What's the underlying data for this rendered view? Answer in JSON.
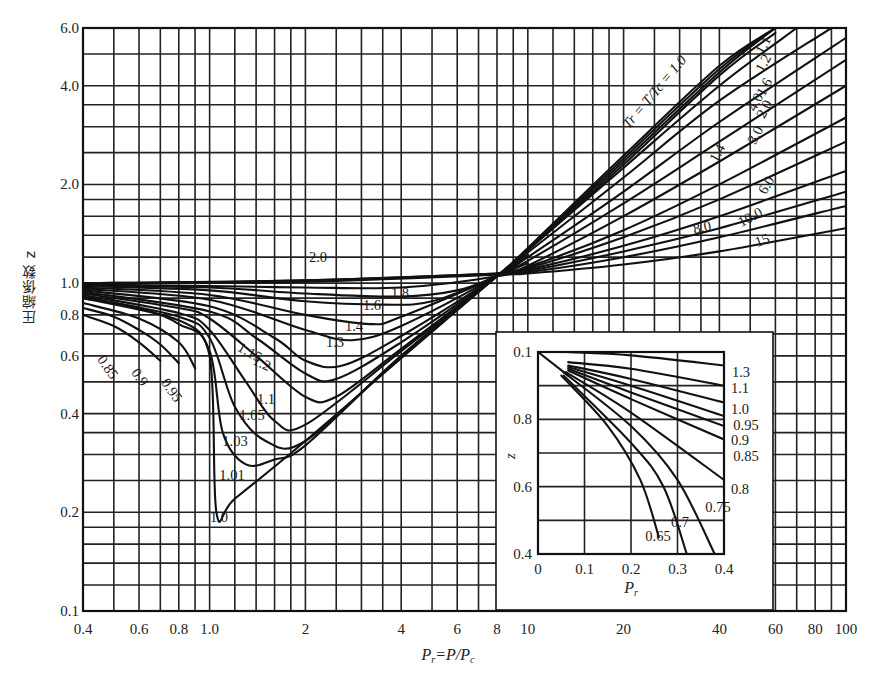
{
  "chart_data": {
    "type": "line",
    "title": "",
    "xlabel": "Pr = P/Pc",
    "ylabel": "圧縮係数 z",
    "xscale": "log",
    "yscale": "log",
    "xlim": [
      0.4,
      100
    ],
    "ylim": [
      0.1,
      6.0
    ],
    "grid": true,
    "legend_position": "none (inline curve labels)",
    "x_tick_labels": [
      "0.4",
      "0.6",
      "0.8",
      "1.0",
      "2",
      "4",
      "6",
      "8",
      "10",
      "20",
      "40",
      "60",
      "80",
      "100"
    ],
    "x_ticks": [
      0.4,
      0.6,
      0.8,
      1.0,
      2,
      4,
      6,
      8,
      10,
      20,
      40,
      60,
      80,
      100
    ],
    "y_tick_labels": [
      "0.1",
      "0.2",
      "0.4",
      "0.6",
      "0.8",
      "1.0",
      "2.0",
      "4.0",
      "6.0"
    ],
    "y_ticks": [
      0.1,
      0.2,
      0.4,
      0.6,
      0.8,
      1.0,
      2.0,
      4.0,
      6.0
    ],
    "family_label": "Tr = T/Tc = 1.0",
    "series": [
      {
        "name": "0.85",
        "x": [
          0.4,
          0.5,
          0.6,
          0.7
        ],
        "z": [
          0.8,
          0.74,
          0.66,
          0.58
        ]
      },
      {
        "name": "0.9",
        "x": [
          0.4,
          0.5,
          0.6,
          0.7,
          0.8
        ],
        "z": [
          0.84,
          0.79,
          0.72,
          0.65,
          0.57
        ]
      },
      {
        "name": "0.95",
        "x": [
          0.4,
          0.6,
          0.8,
          0.9
        ],
        "z": [
          0.87,
          0.78,
          0.66,
          0.55
        ]
      },
      {
        "name": "1.0",
        "x": [
          0.4,
          0.6,
          0.8,
          1.0,
          1.05,
          1.2,
          2,
          4,
          8,
          10,
          20,
          40,
          60
        ],
        "z": [
          0.9,
          0.84,
          0.75,
          0.6,
          0.2,
          0.22,
          0.33,
          0.59,
          1.05,
          1.28,
          2.45,
          4.6,
          6.0
        ]
      },
      {
        "name": "1.01",
        "x": [
          0.4,
          0.8,
          1.0,
          1.1,
          1.3,
          1.6,
          2,
          4,
          8,
          10,
          20,
          40,
          60
        ],
        "z": [
          0.9,
          0.77,
          0.62,
          0.35,
          0.28,
          0.29,
          0.32,
          0.6,
          1.05,
          1.27,
          2.4,
          4.5,
          6.0
        ]
      },
      {
        "name": "1.03",
        "x": [
          0.4,
          0.8,
          1.0,
          1.2,
          1.5,
          2,
          4,
          8,
          10,
          20,
          40,
          60
        ],
        "z": [
          0.91,
          0.79,
          0.68,
          0.42,
          0.33,
          0.33,
          0.6,
          1.05,
          1.27,
          2.35,
          4.4,
          6.0
        ]
      },
      {
        "name": "1.05",
        "x": [
          0.4,
          0.8,
          1.0,
          1.3,
          1.6,
          2,
          4,
          8,
          10,
          20,
          40,
          60
        ],
        "z": [
          0.92,
          0.81,
          0.72,
          0.5,
          0.38,
          0.37,
          0.62,
          1.05,
          1.26,
          2.3,
          4.3,
          5.8
        ]
      },
      {
        "name": "1.1",
        "x": [
          0.4,
          0.8,
          1.0,
          1.4,
          2,
          2.5,
          4,
          8,
          10,
          20,
          40,
          70
        ],
        "z": [
          0.93,
          0.84,
          0.78,
          0.6,
          0.45,
          0.45,
          0.63,
          1.05,
          1.26,
          2.25,
          4.0,
          6.0
        ]
      },
      {
        "name": "1.15",
        "x": [
          0.4,
          1.0,
          1.4,
          2,
          2.5,
          4,
          8,
          10
        ],
        "z": [
          0.94,
          0.82,
          0.68,
          0.53,
          0.51,
          0.66,
          1.05,
          1.25
        ]
      },
      {
        "name": "1.2",
        "x": [
          0.4,
          1.0,
          1.6,
          2,
          2.6,
          4,
          8,
          10,
          20,
          40,
          90
        ],
        "z": [
          0.95,
          0.85,
          0.68,
          0.58,
          0.56,
          0.69,
          1.05,
          1.24,
          2.1,
          3.6,
          6.0
        ]
      },
      {
        "name": "1.3",
        "x": [
          0.4,
          1.0,
          2,
          2.8,
          4,
          8,
          10
        ],
        "z": [
          0.96,
          0.89,
          0.72,
          0.67,
          0.74,
          1.05,
          1.22
        ]
      },
      {
        "name": "1.4",
        "x": [
          0.4,
          1.0,
          2,
          3.2,
          4,
          8,
          10,
          20,
          40,
          100
        ],
        "z": [
          0.97,
          0.92,
          0.8,
          0.75,
          0.79,
          1.05,
          1.2,
          1.9,
          3.1,
          5.6
        ]
      },
      {
        "name": "1.6",
        "x": [
          0.4,
          1.0,
          2,
          3.5,
          5,
          8,
          10,
          20,
          40,
          100
        ],
        "z": [
          0.98,
          0.95,
          0.88,
          0.86,
          0.88,
          1.05,
          1.17,
          1.75,
          2.7,
          4.8
        ]
      },
      {
        "name": "1.8",
        "x": [
          0.4,
          1.0,
          2,
          4,
          6,
          8,
          10
        ],
        "z": [
          0.98,
          0.97,
          0.93,
          0.91,
          0.95,
          1.05,
          1.15
        ]
      },
      {
        "name": "2.0",
        "x": [
          0.4,
          1.0,
          2,
          4,
          8,
          10,
          20,
          40,
          100
        ],
        "z": [
          0.99,
          0.98,
          0.97,
          0.97,
          1.05,
          1.13,
          1.6,
          2.35,
          4.0
        ]
      },
      {
        "name": "3.0",
        "x": [
          8,
          10,
          20,
          40,
          100
        ],
        "z": [
          1.07,
          1.12,
          1.45,
          2.0,
          3.2
        ]
      },
      {
        "name": "4.0",
        "x": [
          8,
          10,
          20,
          40,
          100
        ],
        "z": [
          1.07,
          1.11,
          1.38,
          1.8,
          2.7
        ]
      },
      {
        "name": "6.0",
        "x": [
          8,
          10,
          20,
          40,
          100
        ],
        "z": [
          1.07,
          1.1,
          1.3,
          1.6,
          2.2
        ]
      },
      {
        "name": "8.0",
        "x": [
          0.4,
          2,
          8,
          10,
          20,
          40,
          100
        ],
        "z": [
          1.0,
          1.02,
          1.07,
          1.09,
          1.25,
          1.47,
          1.9
        ]
      },
      {
        "name": "10.0",
        "x": [
          0.4,
          2,
          8,
          10,
          20,
          40,
          100
        ],
        "z": [
          1.0,
          1.02,
          1.07,
          1.08,
          1.2,
          1.38,
          1.72
        ]
      },
      {
        "name": "15",
        "x": [
          0.4,
          2,
          8,
          10,
          20,
          40,
          100
        ],
        "z": [
          1.0,
          1.01,
          1.06,
          1.07,
          1.14,
          1.25,
          1.47
        ]
      }
    ],
    "inset": {
      "type": "line",
      "xlabel": "Pr",
      "ylabel": "z",
      "xscale": "linear",
      "yscale": "linear",
      "xlim": [
        0,
        0.4
      ],
      "ylim": [
        0.4,
        1.0
      ],
      "x_tick_labels": [
        "0",
        "0.1",
        "0.2",
        "0.3",
        "0.4"
      ],
      "y_tick_labels": [
        "0.4",
        "0.6",
        "0.8",
        "0.1"
      ],
      "y_ticks": [
        0.4,
        0.6,
        0.8,
        1.0
      ],
      "note": "top y tick printed as '0.1' (meant 1.0)",
      "saturation_line": {
        "x": [
          0,
          0.065
        ],
        "z": [
          1.0,
          0.93
        ]
      },
      "series": [
        {
          "name": "1.3",
          "x": [
            0.06,
            0.2,
            0.4
          ],
          "z": [
            1.0,
            0.99,
            0.96
          ]
        },
        {
          "name": "1.1",
          "x": [
            0.065,
            0.2,
            0.4
          ],
          "z": [
            0.97,
            0.95,
            0.9
          ]
        },
        {
          "name": "1.0",
          "x": [
            0.065,
            0.2,
            0.4
          ],
          "z": [
            0.96,
            0.92,
            0.85
          ]
        },
        {
          "name": "0.95",
          "x": [
            0.065,
            0.2,
            0.4
          ],
          "z": [
            0.955,
            0.9,
            0.81
          ]
        },
        {
          "name": "0.9",
          "x": [
            0.065,
            0.2,
            0.4
          ],
          "z": [
            0.95,
            0.88,
            0.78
          ]
        },
        {
          "name": "0.85",
          "x": [
            0.065,
            0.2,
            0.4
          ],
          "z": [
            0.945,
            0.86,
            0.74
          ]
        },
        {
          "name": "0.8",
          "x": [
            0.06,
            0.2,
            0.4
          ],
          "z": [
            0.94,
            0.82,
            0.62
          ]
        },
        {
          "name": "0.75",
          "x": [
            0.055,
            0.2,
            0.3,
            0.38
          ],
          "z": [
            0.94,
            0.78,
            0.62,
            0.4
          ]
        },
        {
          "name": "0.7",
          "x": [
            0.055,
            0.2,
            0.27,
            0.32
          ],
          "z": [
            0.93,
            0.73,
            0.6,
            0.4
          ]
        },
        {
          "name": "0.65",
          "x": [
            0.05,
            0.15,
            0.22,
            0.26
          ],
          "z": [
            0.93,
            0.78,
            0.62,
            0.45
          ]
        }
      ]
    }
  },
  "labels": {
    "y_axis_title": "圧縮係数 z",
    "x_axis_title_main": "P",
    "x_axis_title_sub": "r",
    "x_axis_title_rest": "=P/P",
    "x_axis_title_sub2": "c",
    "inset_x_title": "P",
    "inset_x_title_sub": "r",
    "inset_y_title": "z"
  },
  "colors": {
    "ink": "#111111",
    "paper": "#ffffff"
  }
}
